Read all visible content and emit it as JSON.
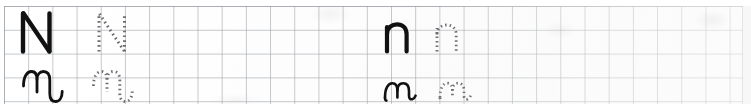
{
  "worksheet": {
    "letter": "N",
    "page_kind": "handwriting-practice-row",
    "paper": "square-grid",
    "grid": {
      "cell_px": 24,
      "line_color": "#969ba0",
      "columns": 30,
      "rows": 4
    },
    "ink_color": "#111111",
    "trace_color": "#6e6e72",
    "rows": [
      {
        "name": "uppercase-row",
        "items": [
          {
            "name": "uppercase-print-model",
            "letter": "N",
            "case": "uppercase",
            "style": "print",
            "render": "solid"
          },
          {
            "name": "uppercase-print-trace",
            "letter": "N",
            "case": "uppercase",
            "style": "print",
            "render": "dotted"
          },
          {
            "name": "lowercase-print-model",
            "letter": "n",
            "case": "lowercase",
            "style": "print",
            "render": "solid"
          },
          {
            "name": "lowercase-print-trace",
            "letter": "n",
            "case": "lowercase",
            "style": "print",
            "render": "dotted"
          }
        ]
      },
      {
        "name": "cursive-row",
        "items": [
          {
            "name": "uppercase-cursive-model",
            "letter": "N",
            "case": "uppercase",
            "style": "cursive",
            "render": "solid"
          },
          {
            "name": "uppercase-cursive-trace",
            "letter": "N",
            "case": "uppercase",
            "style": "cursive",
            "render": "dotted"
          },
          {
            "name": "lowercase-cursive-model",
            "letter": "n",
            "case": "lowercase",
            "style": "cursive",
            "render": "solid"
          },
          {
            "name": "lowercase-cursive-trace",
            "letter": "n",
            "case": "lowercase",
            "style": "cursive",
            "render": "dotted"
          }
        ]
      }
    ]
  }
}
